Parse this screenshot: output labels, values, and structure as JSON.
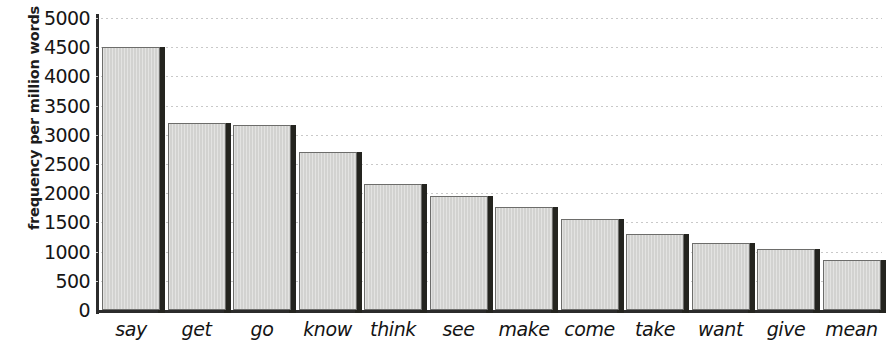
{
  "chart_data": {
    "type": "bar",
    "title": "",
    "subtitle": "",
    "xlabel": "",
    "ylabel": "frequency per million words",
    "categories": [
      "say",
      "get",
      "go",
      "know",
      "think",
      "see",
      "make",
      "come",
      "take",
      "want",
      "give",
      "mean"
    ],
    "values": [
      4500,
      3200,
      3170,
      2700,
      2150,
      1950,
      1760,
      1550,
      1310,
      1140,
      1050,
      860
    ],
    "series": [
      {
        "name": "frequency per million words",
        "values": [
          4500,
          3200,
          3170,
          2700,
          2150,
          1950,
          1760,
          1550,
          1310,
          1140,
          1050,
          860
        ]
      }
    ],
    "ylim": [
      0,
      5000
    ],
    "ytick_step": 500,
    "yticks": [
      5000,
      4500,
      4000,
      3500,
      3000,
      2500,
      2000,
      1500,
      1000,
      500,
      0
    ],
    "ytick_labels": [
      "5000",
      "4500",
      "4000",
      "3500",
      "3000",
      "2500",
      "2000",
      "1500",
      "1000",
      "500",
      "0"
    ],
    "grid": "horizontal-dotted",
    "legend": "none",
    "bar_style": "3d-shadow",
    "colors": {
      "bar_fill": "#d4d4d2",
      "bar_outline": "#6d6d6b",
      "bar_shadow": "#24241f",
      "axis": "#2b2b2b",
      "gridline": "#c9c9c9",
      "text": "#141414",
      "background": "#ffffff"
    }
  }
}
